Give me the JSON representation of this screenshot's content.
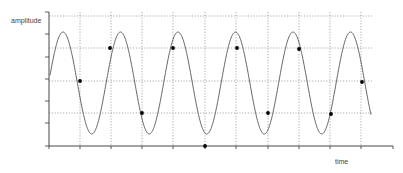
{
  "chart_data": {
    "type": "line",
    "title": "",
    "xlabel": "time",
    "ylabel": "amplitude",
    "grid": true,
    "legend": null,
    "axes": {
      "origin_px": [
        49,
        146
      ],
      "y_axis_top_px": 12,
      "x_axis_right_px": 393,
      "y_ticks_px": [
        12,
        34,
        57,
        79,
        101,
        123,
        146
      ],
      "x_ticks_px": [
        49,
        80,
        111,
        142,
        173,
        205,
        236,
        268,
        299,
        330,
        361,
        393
      ]
    },
    "gridlines": {
      "horizontal_px": [
        16,
        48,
        81,
        113
      ],
      "vertical_px": [
        80,
        111,
        142,
        173,
        205,
        236,
        268,
        299,
        330,
        361
      ],
      "right_extent_px": 372
    },
    "series": [
      {
        "name": "continuous signal",
        "kind": "sine",
        "center_y_px": 83,
        "amplitude_px": 51,
        "period_px": 57.5,
        "first_peak_x_px": 63,
        "x_start_px": 50,
        "x_end_px": 371,
        "color": "#555555"
      },
      {
        "name": "samples",
        "kind": "points",
        "color": "#000000",
        "points_px": [
          [
            80,
            81
          ],
          [
            110,
            48
          ],
          [
            142,
            113
          ],
          [
            173,
            48
          ],
          [
            205,
            146
          ],
          [
            237,
            48
          ],
          [
            268,
            113
          ],
          [
            299,
            49
          ],
          [
            331,
            114
          ],
          [
            362,
            82
          ]
        ]
      }
    ]
  },
  "labels": {
    "y_axis": "amplitude",
    "x_axis": "time"
  }
}
